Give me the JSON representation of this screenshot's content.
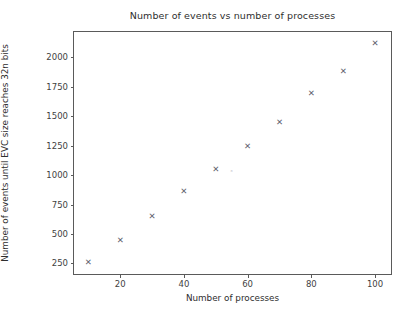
{
  "chart_data": {
    "type": "scatter",
    "title": "Number of events vs number of processes",
    "xlabel": "Number of processes",
    "ylabel": "Number of events until EVC size reaches 32n bits",
    "x": [
      10,
      20,
      30,
      40,
      50,
      55,
      60,
      70,
      80,
      90,
      100
    ],
    "y": [
      260,
      450,
      650,
      865,
      1050,
      1030,
      1245,
      1450,
      1700,
      1880,
      2120
    ],
    "marker": "x",
    "marker_color": "#5d5d6b",
    "points": [
      {
        "x": 10,
        "y": 260,
        "style": "normal"
      },
      {
        "x": 20,
        "y": 450,
        "style": "normal"
      },
      {
        "x": 30,
        "y": 650,
        "style": "normal"
      },
      {
        "x": 40,
        "y": 865,
        "style": "normal"
      },
      {
        "x": 50,
        "y": 1050,
        "style": "normal"
      },
      {
        "x": 55,
        "y": 1030,
        "style": "faint"
      },
      {
        "x": 60,
        "y": 1245,
        "style": "normal"
      },
      {
        "x": 70,
        "y": 1450,
        "style": "normal"
      },
      {
        "x": 80,
        "y": 1700,
        "style": "normal"
      },
      {
        "x": 90,
        "y": 1880,
        "style": "normal"
      },
      {
        "x": 100,
        "y": 2120,
        "style": "normal"
      }
    ],
    "xticks": [
      20,
      40,
      60,
      80,
      100
    ],
    "xtick_labels": [
      "20",
      "40",
      "60",
      "80",
      "100"
    ],
    "yticks": [
      250,
      500,
      750,
      1000,
      1250,
      1500,
      1750,
      2000
    ],
    "ytick_labels": [
      "250",
      "500",
      "750",
      "1000",
      "1250",
      "1500",
      "1750",
      "2000"
    ],
    "xlim": [
      5.5,
      105
    ],
    "ylim": [
      160,
      2215
    ],
    "grid": false,
    "legend": null,
    "frame_color": "#5a5a5a",
    "background": "#ffffff"
  }
}
